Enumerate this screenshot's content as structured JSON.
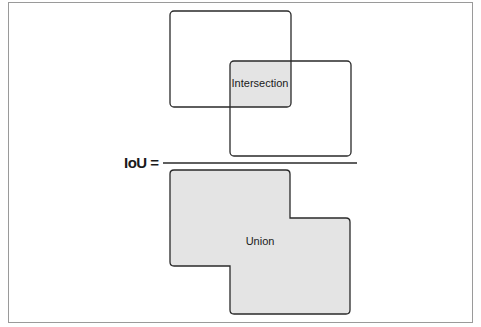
{
  "diagram": {
    "title": "IoU",
    "equation_lhs": "IoU =",
    "numerator_label": "Intersection",
    "denominator_label": "Union",
    "colors": {
      "stroke": "#2a2a2a",
      "fill": "#e4e4e4",
      "background": "#ffffff",
      "frame": "#9a9a9a"
    }
  }
}
